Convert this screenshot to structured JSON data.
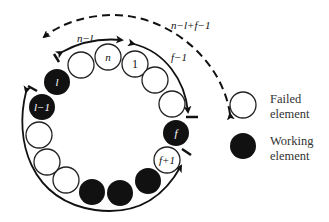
{
  "diagram": {
    "type": "ring-of-elements",
    "element_radius": 13,
    "elements": [
      {
        "cx": 81,
        "cy": 65,
        "state": "failed",
        "label": ""
      },
      {
        "cx": 108,
        "cy": 57,
        "state": "failed",
        "label": "n"
      },
      {
        "cx": 135,
        "cy": 64,
        "state": "failed",
        "label": "1"
      },
      {
        "cx": 155,
        "cy": 80,
        "state": "failed",
        "label": ""
      },
      {
        "cx": 172,
        "cy": 104,
        "state": "failed",
        "label": ""
      },
      {
        "cx": 176,
        "cy": 133,
        "state": "working",
        "label": "f"
      },
      {
        "cx": 167,
        "cy": 160,
        "state": "failed",
        "label": "f+1"
      },
      {
        "cx": 148,
        "cy": 181,
        "state": "working",
        "label": ""
      },
      {
        "cx": 120,
        "cy": 193,
        "state": "working",
        "label": ""
      },
      {
        "cx": 92,
        "cy": 192,
        "state": "working",
        "label": ""
      },
      {
        "cx": 66,
        "cy": 180,
        "state": "failed",
        "label": ""
      },
      {
        "cx": 47,
        "cy": 162,
        "state": "failed",
        "label": ""
      },
      {
        "cx": 39,
        "cy": 135,
        "state": "failed",
        "label": ""
      },
      {
        "cx": 42,
        "cy": 107,
        "state": "working",
        "label": "l−1"
      },
      {
        "cx": 57,
        "cy": 82,
        "state": "working",
        "label": "l"
      }
    ],
    "arrows": [
      {
        "label": "n−l",
        "style": "solid",
        "direction": "bidirectional"
      },
      {
        "label": "f−1",
        "style": "solid",
        "direction": "to-f"
      },
      {
        "label": "n−l+f−1",
        "style": "dashed",
        "direction": "to-legend-side"
      },
      {
        "label": "",
        "style": "solid",
        "direction": "bidirectional",
        "span": "l−1 to f+1 (bottom)"
      }
    ],
    "labels": {
      "n_minus_l": "n−l",
      "f_minus_1": "f−1",
      "n_minus_l_plus_f_minus_1": "n−l+f−1"
    }
  },
  "legend": {
    "failed": {
      "line1": "Failed",
      "line2": "element"
    },
    "working": {
      "line1": "Working",
      "line2": "element"
    }
  },
  "colors": {
    "failed_fill": "#ffffff",
    "working_fill": "#111111",
    "stroke": "#222222"
  }
}
